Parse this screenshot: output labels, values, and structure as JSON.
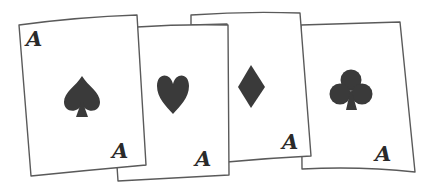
{
  "scene": {
    "description": "Four aces playing cards fanned out",
    "background": "#ffffff",
    "ink_color": "#3a3a3a",
    "outline_color": "#5a5a5a"
  },
  "cards": [
    {
      "rank": "A",
      "suit": "spades",
      "suit_icon": "spade-icon",
      "corners": [
        "top-left",
        "bottom-right"
      ]
    },
    {
      "rank": "A",
      "suit": "hearts",
      "suit_icon": "heart-icon",
      "corners": [
        "bottom-right"
      ]
    },
    {
      "rank": "A",
      "suit": "diamonds",
      "suit_icon": "diamond-icon",
      "corners": [
        "bottom-right"
      ]
    },
    {
      "rank": "A",
      "suit": "clubs",
      "suit_icon": "club-icon",
      "corners": [
        "bottom-right"
      ]
    }
  ]
}
